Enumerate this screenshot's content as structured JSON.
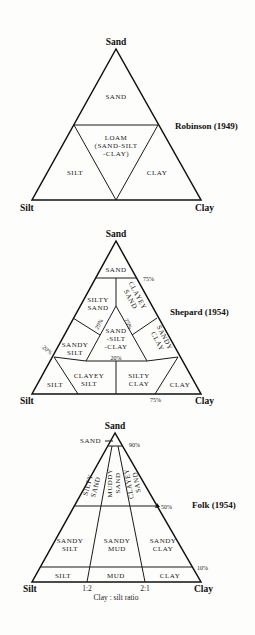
{
  "diagrams": [
    {
      "title": "Robinson (1949)",
      "vertices": {
        "top": "Sand",
        "left": "Silt",
        "right": "Clay"
      },
      "regions": [
        {
          "lines": [
            "SAND"
          ]
        },
        {
          "lines": [
            "LOAM",
            "(SAND-SILT",
            "-CLAY)"
          ]
        },
        {
          "lines": [
            "SILT"
          ]
        },
        {
          "lines": [
            "CLAY"
          ]
        }
      ]
    },
    {
      "title": "Shepard (1954)",
      "vertices": {
        "top": "Sand",
        "left": "Silt",
        "right": "Clay"
      },
      "regions": [
        {
          "lines": [
            "SAND"
          ]
        },
        {
          "lines": [
            "SILTY",
            "SAND"
          ]
        },
        {
          "lines": [
            "CLAYEY",
            "SAND"
          ]
        },
        {
          "lines": [
            "SAND",
            "-SILT",
            "-CLAY"
          ]
        },
        {
          "lines": [
            "SANDY",
            "SILT"
          ]
        },
        {
          "lines": [
            "SANDY",
            "CLAY"
          ]
        },
        {
          "lines": [
            "SILT"
          ]
        },
        {
          "lines": [
            "CLAYEY",
            "SILT"
          ]
        },
        {
          "lines": [
            "SILTY",
            "CLAY"
          ]
        },
        {
          "lines": [
            "CLAY"
          ]
        }
      ],
      "percent_labels": [
        "75%",
        "20%",
        "20%",
        "75%",
        "20%",
        "75%"
      ]
    },
    {
      "title": "Folk (1954)",
      "vertices": {
        "top": "Sand",
        "left": "Silt",
        "right": "Clay"
      },
      "regions": [
        {
          "lines": [
            "SAND"
          ]
        },
        {
          "lines": [
            "SILTY",
            "SAND"
          ]
        },
        {
          "lines": [
            "MUDDY",
            "SAND"
          ]
        },
        {
          "lines": [
            "CLAYEY",
            "SAND"
          ]
        },
        {
          "lines": [
            "SANDY",
            "SILT"
          ]
        },
        {
          "lines": [
            "SANDY",
            "MUD"
          ]
        },
        {
          "lines": [
            "SANDY",
            "CLAY"
          ]
        },
        {
          "lines": [
            "SILT"
          ]
        },
        {
          "lines": [
            "MUD"
          ]
        },
        {
          "lines": [
            "CLAY"
          ]
        }
      ],
      "percent_labels": [
        "90%",
        "50%",
        "10%"
      ],
      "ratio_ticks": [
        "1:2",
        "2:1"
      ],
      "ratio_caption": "Clay : silt ratio"
    }
  ]
}
